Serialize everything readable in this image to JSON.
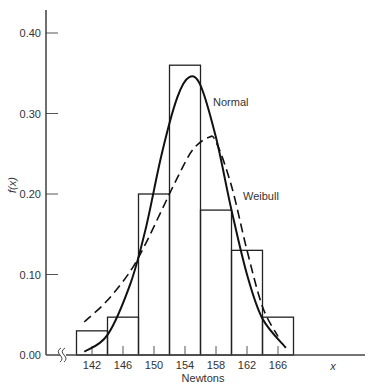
{
  "chart_data": {
    "type": "bar",
    "subtype": "histogram with fitted density curves",
    "title": "",
    "xlabel": "Newtons",
    "ylabel": "f(x)",
    "x_axis_end_label": "x",
    "x_ticks": [
      142,
      146,
      150,
      154,
      158,
      162,
      166
    ],
    "y_ticks": [
      "0.00",
      "0.10",
      "0.20",
      "0.30",
      "0.40"
    ],
    "ylim": [
      0,
      0.43
    ],
    "xlim": [
      138,
      178
    ],
    "axis_break": true,
    "grid": false,
    "bins": [
      {
        "from": 140,
        "to": 144,
        "center": 142,
        "value": 0.03
      },
      {
        "from": 144,
        "to": 148,
        "center": 146,
        "value": 0.047
      },
      {
        "from": 148,
        "to": 152,
        "center": 150,
        "value": 0.2
      },
      {
        "from": 152,
        "to": 156,
        "center": 154,
        "value": 0.36
      },
      {
        "from": 156,
        "to": 160,
        "center": 158,
        "value": 0.18
      },
      {
        "from": 160,
        "to": 164,
        "center": 162,
        "value": 0.13
      },
      {
        "from": 164,
        "to": 168,
        "center": 166,
        "value": 0.047
      }
    ],
    "categories": [
      "142",
      "146",
      "150",
      "154",
      "158",
      "162",
      "166"
    ],
    "values": [
      0.03,
      0.047,
      0.2,
      0.36,
      0.18,
      0.13,
      0.047
    ],
    "series": [
      {
        "name": "Normal",
        "style": "solid",
        "x": [
          141,
          144,
          147,
          149,
          151,
          153,
          154.5,
          156,
          158,
          160,
          162,
          164,
          167
        ],
        "y": [
          0.004,
          0.025,
          0.09,
          0.16,
          0.25,
          0.32,
          0.345,
          0.335,
          0.27,
          0.18,
          0.1,
          0.045,
          0.009
        ]
      },
      {
        "name": "Weibull",
        "style": "dashed",
        "x": [
          141,
          144,
          147,
          149,
          151,
          153,
          155,
          157,
          158,
          160,
          162,
          164,
          166
        ],
        "y": [
          0.041,
          0.068,
          0.105,
          0.14,
          0.18,
          0.22,
          0.255,
          0.27,
          0.265,
          0.21,
          0.13,
          0.06,
          0.023
        ]
      }
    ],
    "annotations": [
      {
        "text": "Normal",
        "near": "peak of solid curve"
      },
      {
        "text": "Weibull",
        "near": "right flank of dashed curve"
      }
    ],
    "legend": "none (inline curve labels)"
  }
}
